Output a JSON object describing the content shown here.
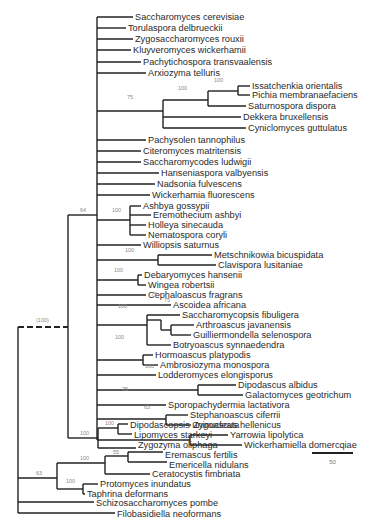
{
  "figure": {
    "type": "phylogenetic-tree",
    "scale_bar": {
      "label": "50",
      "x1": 312,
      "x2": 353,
      "y": 453
    },
    "colors": {
      "line": "#222222",
      "text": "#2a2a2a",
      "bootstrap": "#8a8a8a"
    }
  },
  "taxa": [
    {
      "name": "Saccharomyces cerevisiae",
      "x": 135,
      "y": 17
    },
    {
      "name": "Torulaspora delbrueckii",
      "x": 128,
      "y": 28
    },
    {
      "name": "Zygosaccharomyces rouxii",
      "x": 135,
      "y": 39
    },
    {
      "name": "Kluyveromyces wickerhamii",
      "x": 133,
      "y": 50
    },
    {
      "name": "Pachytichospora transvaalensis",
      "x": 143,
      "y": 62
    },
    {
      "name": "Arxiozyma telluris",
      "x": 148,
      "y": 73
    },
    {
      "name": "Issatchenkia orientalis",
      "x": 252,
      "y": 86
    },
    {
      "name": "Pichia membranaefaciens",
      "x": 252,
      "y": 95
    },
    {
      "name": "Saturnospora dispora",
      "x": 248,
      "y": 106
    },
    {
      "name": "Dekkera bruxellensis",
      "x": 243,
      "y": 117
    },
    {
      "name": "Cyniclomyces guttulatus",
      "x": 248,
      "y": 128
    },
    {
      "name": "Pachysolen tannophilus",
      "x": 148,
      "y": 140
    },
    {
      "name": "Citeromyces matritensis",
      "x": 143,
      "y": 151
    },
    {
      "name": "Saccharomycodes ludwigii",
      "x": 143,
      "y": 162
    },
    {
      "name": "Hanseniaspora valbyensis",
      "x": 161,
      "y": 173
    },
    {
      "name": "Nadsonia fulvescens",
      "x": 157,
      "y": 184
    },
    {
      "name": "Wickerhamia fluorescens",
      "x": 152,
      "y": 195
    },
    {
      "name": "Ashbya gossypii",
      "x": 143,
      "y": 206
    },
    {
      "name": "Eremothecium ashbyi",
      "x": 153,
      "y": 215
    },
    {
      "name": "Holleya sinecauda",
      "x": 148,
      "y": 225
    },
    {
      "name": "Nematospora coryli",
      "x": 148,
      "y": 235
    },
    {
      "name": "Williopsis saturnus",
      "x": 143,
      "y": 245
    },
    {
      "name": "Metschnikowia bicuspidata",
      "x": 214,
      "y": 255
    },
    {
      "name": "Clavispora lusitaniae",
      "x": 218,
      "y": 265
    },
    {
      "name": "Debaryomyces hansenii",
      "x": 144,
      "y": 275
    },
    {
      "name": "Wingea robertsii",
      "x": 148,
      "y": 285
    },
    {
      "name": "Cephaloascus fragrans",
      "x": 148,
      "y": 295
    },
    {
      "name": "Ascoidea africana",
      "x": 173,
      "y": 305
    },
    {
      "name": "Saccharomycopsis fibuligera",
      "x": 182,
      "y": 315
    },
    {
      "name": "Arthroascus javanensis",
      "x": 196,
      "y": 325
    },
    {
      "name": "Guilliermondella selenospora",
      "x": 193,
      "y": 335
    },
    {
      "name": "Botryoascus synnaedendra",
      "x": 173,
      "y": 345
    },
    {
      "name": "Hormoascus platypodis",
      "x": 155,
      "y": 355
    },
    {
      "name": "Ambrosiozyma monospora",
      "x": 160,
      "y": 365
    },
    {
      "name": "Lodderomyces elongisporus",
      "x": 158,
      "y": 375
    },
    {
      "name": "Dipodascus albidus",
      "x": 238,
      "y": 385
    },
    {
      "name": "Galactomyces geotrichum",
      "x": 245,
      "y": 395
    },
    {
      "name": "Sporopachydermia lactativora",
      "x": 168,
      "y": 405
    },
    {
      "name": "Stephanoascus ciferrii",
      "x": 190,
      "y": 415
    },
    {
      "name": "Zygoascus hellenicus",
      "x": 193,
      "y": 425
    },
    {
      "name": "Yarrowia lipolytica",
      "x": 230,
      "y": 435
    },
    {
      "name": "Wickerhamiella domercqiae",
      "x": 244,
      "y": 445
    },
    {
      "name": "Dipodascopsis uninucleata",
      "x": 130,
      "y": 425
    },
    {
      "name": "Lipomyces starkeyi",
      "x": 134,
      "y": 435
    },
    {
      "name": "Zygozyma oliphaga",
      "x": 138,
      "y": 445
    },
    {
      "name": "Eremascus fertilis",
      "x": 165,
      "y": 455
    },
    {
      "name": "Emericella nidulans",
      "x": 169,
      "y": 465
    },
    {
      "name": "Ceratocystis fimbriata",
      "x": 152,
      "y": 474
    },
    {
      "name": "Protomyces inundatus",
      "x": 100,
      "y": 484
    },
    {
      "name": "Taphrina deformans",
      "x": 87,
      "y": 494
    },
    {
      "name": "Schizosaccharomyces pombe",
      "x": 96,
      "y": 503
    },
    {
      "name": "Filobasidiella neoformans",
      "x": 117,
      "y": 514
    }
  ],
  "bootstrap": [
    {
      "label": "100",
      "x": 214,
      "y": 82
    },
    {
      "label": "100",
      "x": 178,
      "y": 90
    },
    {
      "label": "75",
      "x": 127,
      "y": 99
    },
    {
      "label": "100",
      "x": 112,
      "y": 212
    },
    {
      "label": "64",
      "x": 80,
      "y": 212
    },
    {
      "label": "100",
      "x": 125,
      "y": 252
    },
    {
      "label": "100",
      "x": 114,
      "y": 272
    },
    {
      "label": "75",
      "x": 151,
      "y": 296
    },
    {
      "label": "75",
      "x": 164,
      "y": 302
    },
    {
      "label": "100",
      "x": 118,
      "y": 308
    },
    {
      "label": "100",
      "x": 115,
      "y": 339
    },
    {
      "label": "100",
      "x": 145,
      "y": 368
    },
    {
      "label": "75",
      "x": 122,
      "y": 391
    },
    {
      "label": "63",
      "x": 144,
      "y": 409
    },
    {
      "label": "(100)",
      "x": 36,
      "y": 322
    },
    {
      "label": "100",
      "x": 105,
      "y": 425
    },
    {
      "label": "100",
      "x": 80,
      "y": 435
    },
    {
      "label": "55",
      "x": 113,
      "y": 454
    },
    {
      "label": "100",
      "x": 80,
      "y": 460
    },
    {
      "label": "63",
      "x": 36,
      "y": 475
    },
    {
      "label": "100",
      "x": 66,
      "y": 483
    }
  ],
  "branches": [
    [
      97,
      17,
      97,
      398
    ],
    [
      97,
      17,
      133,
      17
    ],
    [
      97,
      28,
      126,
      28
    ],
    [
      97,
      39,
      133,
      39
    ],
    [
      97,
      50,
      131,
      50
    ],
    [
      97,
      62,
      141,
      62
    ],
    [
      97,
      73,
      146,
      73
    ],
    [
      97,
      111,
      163,
      111
    ],
    [
      163,
      100,
      163,
      122
    ],
    [
      163,
      100,
      208,
      100
    ],
    [
      208,
      91,
      208,
      106
    ],
    [
      208,
      91,
      238,
      91
    ],
    [
      238,
      86,
      238,
      95
    ],
    [
      238,
      86,
      250,
      86
    ],
    [
      238,
      95,
      250,
      95
    ],
    [
      208,
      106,
      246,
      106
    ],
    [
      163,
      117,
      241,
      117
    ],
    [
      163,
      122,
      163,
      128
    ],
    [
      163,
      128,
      246,
      128
    ],
    [
      97,
      140,
      146,
      140
    ],
    [
      97,
      151,
      141,
      151
    ],
    [
      97,
      162,
      141,
      162
    ],
    [
      97,
      173,
      159,
      173
    ],
    [
      97,
      184,
      155,
      184
    ],
    [
      97,
      195,
      150,
      195
    ],
    [
      97,
      220,
      130,
      220
    ],
    [
      130,
      206,
      130,
      235
    ],
    [
      130,
      206,
      141,
      206
    ],
    [
      130,
      215,
      151,
      215
    ],
    [
      130,
      225,
      146,
      225
    ],
    [
      130,
      235,
      146,
      235
    ],
    [
      97,
      245,
      141,
      245
    ],
    [
      97,
      260,
      158,
      260
    ],
    [
      158,
      255,
      158,
      265
    ],
    [
      158,
      255,
      212,
      255
    ],
    [
      158,
      265,
      216,
      265
    ],
    [
      97,
      280,
      138,
      280
    ],
    [
      138,
      275,
      138,
      285
    ],
    [
      138,
      275,
      142,
      275
    ],
    [
      138,
      285,
      146,
      285
    ],
    [
      97,
      295,
      146,
      295
    ],
    [
      97,
      305,
      171,
      305
    ],
    [
      97,
      325,
      147,
      325
    ],
    [
      147,
      315,
      147,
      345
    ],
    [
      147,
      315,
      180,
      315
    ],
    [
      161,
      320,
      161,
      330
    ],
    [
      147,
      320,
      161,
      320
    ],
    [
      161,
      330,
      171,
      330
    ],
    [
      171,
      325,
      171,
      335
    ],
    [
      171,
      325,
      194,
      325
    ],
    [
      171,
      335,
      191,
      335
    ],
    [
      147,
      345,
      171,
      345
    ],
    [
      97,
      360,
      143,
      360
    ],
    [
      143,
      355,
      143,
      365
    ],
    [
      143,
      355,
      153,
      355
    ],
    [
      143,
      365,
      158,
      365
    ],
    [
      97,
      375,
      156,
      375
    ],
    [
      97,
      390,
      198,
      390
    ],
    [
      198,
      385,
      198,
      395
    ],
    [
      198,
      385,
      236,
      385
    ],
    [
      198,
      395,
      243,
      395
    ],
    [
      97,
      405,
      166,
      405
    ],
    [
      97,
      419,
      166,
      419
    ],
    [
      166,
      415,
      166,
      425
    ],
    [
      166,
      415,
      188,
      415
    ],
    [
      166,
      425,
      191,
      425
    ],
    [
      97,
      398,
      97,
      440
    ],
    [
      97,
      440,
      190,
      440
    ],
    [
      190,
      435,
      190,
      445
    ],
    [
      190,
      435,
      228,
      435
    ],
    [
      190,
      445,
      242,
      445
    ],
    [
      68,
      215,
      97,
      215
    ],
    [
      68,
      215,
      68,
      438
    ],
    [
      68,
      438,
      98,
      438
    ],
    [
      98,
      428,
      98,
      448
    ],
    [
      98,
      428,
      118,
      428
    ],
    [
      118,
      424,
      118,
      434
    ],
    [
      118,
      424,
      128,
      424
    ],
    [
      118,
      434,
      132,
      434
    ],
    [
      98,
      448,
      136,
      448
    ],
    [
      18,
      327,
      18,
      513
    ],
    [
      18,
      478,
      57,
      478
    ],
    [
      57,
      463,
      57,
      489
    ],
    [
      57,
      463,
      105,
      463
    ],
    [
      105,
      456,
      105,
      474
    ],
    [
      105,
      456,
      128,
      456
    ],
    [
      128,
      452,
      128,
      462
    ],
    [
      128,
      452,
      163,
      452
    ],
    [
      128,
      462,
      167,
      462
    ],
    [
      105,
      474,
      150,
      474
    ],
    [
      57,
      489,
      83,
      489
    ],
    [
      83,
      484,
      83,
      494
    ],
    [
      83,
      484,
      98,
      484
    ],
    [
      83,
      494,
      85,
      494
    ],
    [
      18,
      502,
      94,
      502
    ],
    [
      18,
      513,
      115,
      513
    ]
  ],
  "dashed_branches": [
    [
      18,
      327,
      68,
      327
    ]
  ]
}
